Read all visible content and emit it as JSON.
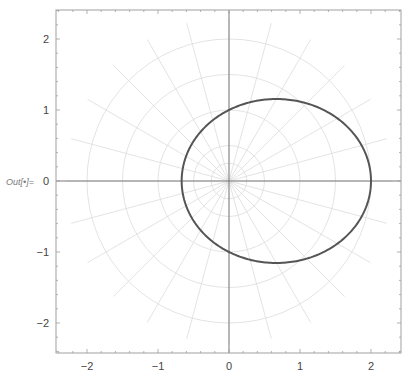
{
  "cell": {
    "output_label": "Out[•]="
  },
  "colors": {
    "curve": "#555555",
    "axes": "#7a7a7a",
    "grid": "#dcdcdc",
    "frame": "#a0a0a0",
    "tick_text": "#444444"
  },
  "chart_data": {
    "type": "line",
    "subtype": "polar",
    "title": "",
    "xlabel": "",
    "ylabel": "",
    "equation": "r = 1/(1 - 0.5 cos(theta))",
    "eccentricity": 0.5,
    "semi_latus_rectum": 1,
    "series": [
      {
        "name": "r(θ)",
        "theta_deg": [
          0,
          30,
          60,
          90,
          120,
          150,
          180,
          210,
          240,
          270,
          300,
          330,
          360
        ],
        "r": [
          2.0,
          1.76,
          1.33,
          1.0,
          0.8,
          0.7,
          0.667,
          0.7,
          0.8,
          1.0,
          1.33,
          1.76,
          2.0
        ],
        "x": [
          2.0,
          1.52,
          0.67,
          0.0,
          -0.4,
          -0.6,
          -0.667,
          -0.6,
          -0.4,
          0.0,
          0.67,
          1.52,
          2.0
        ],
        "y": [
          0.0,
          0.88,
          1.15,
          1.0,
          0.69,
          0.35,
          0.0,
          -0.35,
          -0.69,
          -1.0,
          -1.15,
          -0.88,
          0.0
        ]
      }
    ],
    "ellipse": {
      "center": [
        0.667,
        0
      ],
      "semi_major": 1.333,
      "semi_minor": 1.155
    },
    "xlim": [
      -2.44,
      2.44
    ],
    "ylim": [
      -2.42,
      2.42
    ],
    "x_ticks": [
      "-2",
      "-1",
      "0",
      "1",
      "2"
    ],
    "y_ticks": [
      "2",
      "1",
      "0",
      "-1",
      "-2"
    ],
    "polar_grid": {
      "radii": [
        0.25,
        0.5,
        1.0,
        1.5,
        2.0
      ],
      "angle_step_deg": 15,
      "ray_length": 2.3
    },
    "grid": true,
    "legend": null
  }
}
